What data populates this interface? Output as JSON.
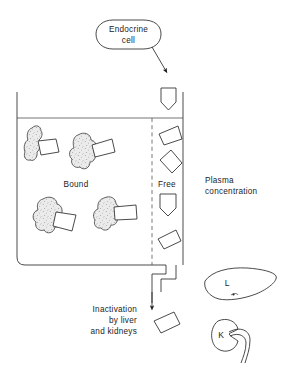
{
  "figure": {
    "background": "#ffffff",
    "ink_color": "#2a2a2a",
    "blob_fill": "#e9e9e9",
    "hormone_fill": "#ffffff"
  },
  "labels": {
    "endocrine_cell_line1": "Endocrine",
    "endocrine_cell_line2": "cell",
    "bound": "Bound",
    "free": "Free",
    "plasma_line1": "Plasma",
    "plasma_line2": "concentration",
    "inactivation_line1": "Inactivation",
    "inactivation_line2": "by liver",
    "inactivation_line3": "and kidneys",
    "liver_initial": "L",
    "kidney_initial": "K"
  },
  "elements": {
    "endocrine_cell_bubble": "rounded-capsule-cell",
    "secretion_arrow": "arrow-down-right",
    "plasma_container": "open-top-vessel",
    "fluid_level_line": "horizontal-line",
    "bound_free_divider": "vertical-dashed-line",
    "outflow_channel": "stepped-pipe",
    "clearance_arrow": "arrow-down",
    "liver_organ": "liver-silhouette",
    "kidney_organ": "kidney-bean-with-ureter"
  },
  "counts": {
    "bound_complexes": 4,
    "free_hormones_in_plasma": 5,
    "hormones_entering": 1,
    "hormones_cleared": 1
  }
}
